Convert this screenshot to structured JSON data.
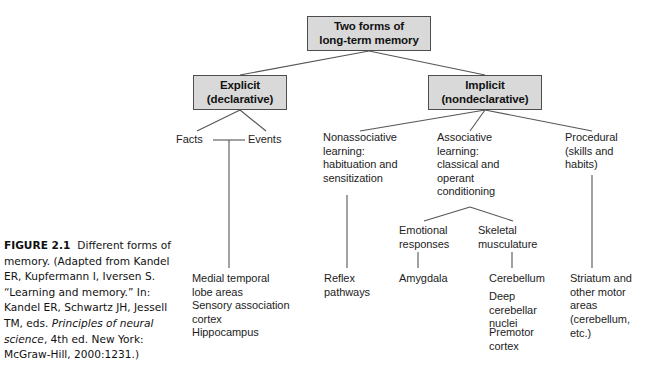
{
  "figure": {
    "number": "FIGURE 2.1",
    "caption_part1": "Different forms of memory. (Adapted from Kandel ER, Kupfermann I, Iversen S. “Learning and memory.” In: Kandel ER, Schwartz JH, Jessell TM, eds. ",
    "caption_italic": "Principles of neural science",
    "caption_part2": ", 4th ed. New York: McGraw-Hill, 2000:1231.)"
  },
  "diagram": {
    "type": "hierarchy-tree",
    "root": {
      "line1": "Two forms of",
      "line2": "long-term memory"
    },
    "branches": {
      "explicit": {
        "line1": "Explicit",
        "line2": "(declarative)"
      },
      "implicit": {
        "line1": "Implicit",
        "line2": "(nondeclarative)"
      }
    },
    "explicit_children": {
      "facts": "Facts",
      "events": "Events",
      "structures": {
        "medial": "Medial temporal\nlobe areas",
        "sensory": "Sensory association\ncortex",
        "hippocampus": "Hippocampus"
      }
    },
    "implicit_children": {
      "nonassociative": "Nonassociative\nlearning:\nhabituation and\nsensitization",
      "associative": "Associative\nlearning:\nclassical and\noperant\nconditioning",
      "procedural": "Procedural\n(skills and\nhabits)"
    },
    "associative_children": {
      "emotional": "Emotional\nresponses",
      "skeletal": "Skeletal\nmusculature"
    },
    "leaf_structures": {
      "reflex": "Reflex\npathways",
      "amygdala": "Amygdala",
      "cerebellum": "Cerebellum",
      "deep_nuclei": "Deep\ncerebellar\nnuclei",
      "premotor": "Premotor\ncortex",
      "striatum": "Striatum and\nother motor\nareas",
      "striatum_paren": "(cerebellum,\netc.)"
    },
    "colors": {
      "box_fill": "#d9d9d9",
      "box_border": "#4d4d4d",
      "line": "#555555",
      "text": "#1a1a1a",
      "background": "#ffffff"
    }
  }
}
